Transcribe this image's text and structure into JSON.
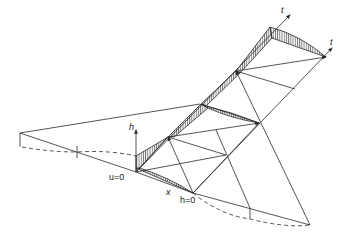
{
  "diagram": {
    "type": "characteristic-wave-propagation-sketch",
    "labels": {
      "h_axis": "h",
      "u_zero": "u=0",
      "h_zero": "h=0",
      "x_axis": "x",
      "t_axis_top": "t",
      "t_axis_right": "t"
    },
    "colors": {
      "line": "#2a2a2a",
      "background": "#ffffff"
    }
  }
}
